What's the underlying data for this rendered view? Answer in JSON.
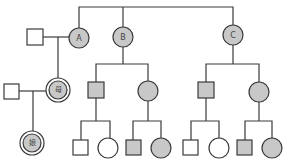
{
  "colors": {
    "affected": "#c8c8c8",
    "unaffected": "#ffffff",
    "stroke": "#3a3a3a"
  },
  "diagram": {
    "type": "pedigree",
    "labels": {
      "A": "A",
      "B": "B",
      "C": "C",
      "mother": "母",
      "daughter": "娘"
    }
  },
  "nodes": [
    {
      "id": "husband-of-A",
      "sex": "male",
      "affected": false
    },
    {
      "id": "A",
      "sex": "female",
      "affected": true,
      "label": "A"
    },
    {
      "id": "B",
      "sex": "female",
      "affected": true,
      "label": "B"
    },
    {
      "id": "C",
      "sex": "female",
      "affected": true,
      "label": "C"
    },
    {
      "id": "father",
      "sex": "male",
      "affected": false
    },
    {
      "id": "mother",
      "sex": "female",
      "affected": true,
      "label": "母",
      "proband_ring": true
    },
    {
      "id": "daughter",
      "sex": "female",
      "affected": true,
      "label": "娘",
      "proband_ring": true
    },
    {
      "id": "B-son",
      "sex": "male",
      "affected": true
    },
    {
      "id": "B-daughter",
      "sex": "female",
      "affected": true
    },
    {
      "id": "C-son",
      "sex": "male",
      "affected": true
    },
    {
      "id": "C-daughter",
      "sex": "female",
      "affected": true
    },
    {
      "id": "B-son-child-1",
      "sex": "male",
      "affected": false
    },
    {
      "id": "B-son-child-2",
      "sex": "female",
      "affected": false
    },
    {
      "id": "B-daughter-child-1",
      "sex": "male",
      "affected": true
    },
    {
      "id": "B-daughter-child-2",
      "sex": "female",
      "affected": true
    },
    {
      "id": "C-son-child-1",
      "sex": "male",
      "affected": false
    },
    {
      "id": "C-son-child-2",
      "sex": "female",
      "affected": false
    },
    {
      "id": "C-daughter-child-1",
      "sex": "male",
      "affected": true
    },
    {
      "id": "C-daughter-child-2",
      "sex": "female",
      "affected": true
    }
  ]
}
